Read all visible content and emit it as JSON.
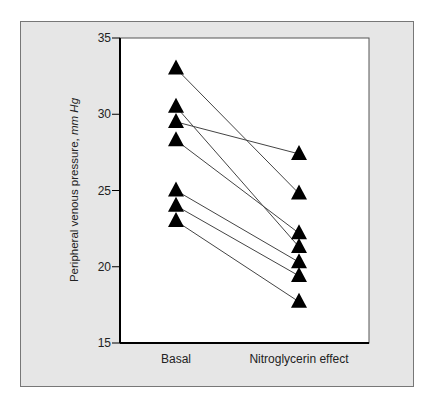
{
  "chart_data": {
    "type": "line",
    "subtype": "paired-slope",
    "title": "",
    "xlabel": "",
    "ylabel": "Peripheral venous pressure, ",
    "ylabel_unit": "mm Hg",
    "ylim": [
      15,
      35
    ],
    "yticks": [
      15,
      20,
      25,
      30,
      35
    ],
    "ytick_labels": [
      "15",
      "20",
      "25",
      "30",
      "35"
    ],
    "categories": [
      "Basal",
      "Nitroglycerin effect"
    ],
    "grid": false,
    "legend": null,
    "marker": "filled-triangle",
    "series": [
      {
        "name": "Subject 1",
        "values": [
          33.0,
          24.8
        ]
      },
      {
        "name": "Subject 2",
        "values": [
          30.5,
          21.3
        ]
      },
      {
        "name": "Subject 3",
        "values": [
          29.5,
          27.4
        ]
      },
      {
        "name": "Subject 4",
        "values": [
          28.3,
          22.2
        ]
      },
      {
        "name": "Subject 5",
        "values": [
          25.0,
          20.3
        ]
      },
      {
        "name": "Subject 6",
        "values": [
          24.0,
          19.4
        ]
      },
      {
        "name": "Subject 7",
        "values": [
          23.0,
          17.7
        ]
      }
    ]
  },
  "colors": {
    "panel_bg": "#e6e6e6",
    "plot_bg": "#ffffff",
    "marker": "#000000",
    "line": "#444444"
  }
}
